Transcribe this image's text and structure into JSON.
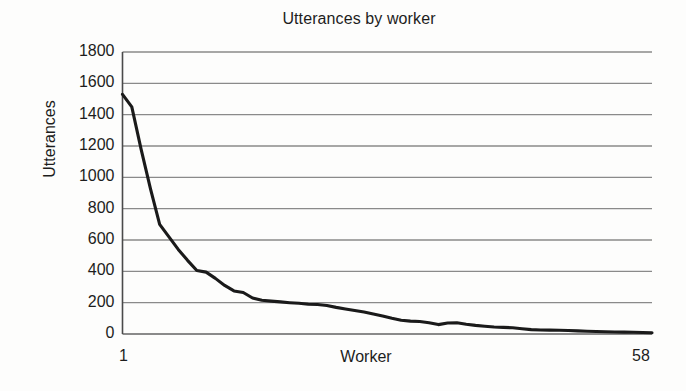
{
  "chart_data": {
    "type": "line",
    "title": "Utterances by worker",
    "xlabel": "Worker",
    "ylabel": "Utterances",
    "xlim": [
      1,
      58
    ],
    "ylim": [
      0,
      1800
    ],
    "grid": true,
    "legend": null,
    "legend_position": "none",
    "xtick_labels": [
      "1",
      "58"
    ],
    "ytick_labels": [
      "0",
      "200",
      "400",
      "600",
      "800",
      "1000",
      "1200",
      "1400",
      "1600",
      "1800"
    ],
    "ytick_values": [
      0,
      200,
      400,
      600,
      800,
      1000,
      1200,
      1400,
      1600,
      1800
    ],
    "line_color": "#1a1a1a",
    "grid_color": "#8a8a8a",
    "background_color": "#fdfdfc",
    "x": [
      1,
      2,
      3,
      4,
      5,
      6,
      7,
      8,
      9,
      10,
      11,
      12,
      13,
      14,
      15,
      16,
      17,
      18,
      19,
      20,
      21,
      22,
      23,
      24,
      25,
      26,
      27,
      28,
      29,
      30,
      31,
      32,
      33,
      34,
      35,
      36,
      37,
      38,
      39,
      40,
      41,
      42,
      43,
      44,
      45,
      46,
      47,
      48,
      49,
      50,
      51,
      52,
      53,
      54,
      55,
      56,
      57,
      58
    ],
    "values": [
      1530,
      1450,
      1180,
      930,
      700,
      620,
      540,
      470,
      405,
      395,
      355,
      310,
      275,
      265,
      230,
      215,
      210,
      205,
      200,
      196,
      190,
      188,
      182,
      170,
      160,
      150,
      140,
      128,
      115,
      100,
      88,
      82,
      80,
      72,
      60,
      70,
      72,
      62,
      55,
      50,
      45,
      42,
      40,
      34,
      28,
      26,
      25,
      24,
      22,
      20,
      18,
      16,
      14,
      13,
      12,
      11,
      10,
      8
    ],
    "series": [
      {
        "name": "Utterances",
        "values": [
          1530,
          1450,
          1180,
          930,
          700,
          620,
          540,
          470,
          405,
          395,
          355,
          310,
          275,
          265,
          230,
          215,
          210,
          205,
          200,
          196,
          190,
          188,
          182,
          170,
          160,
          150,
          140,
          128,
          115,
          100,
          88,
          82,
          80,
          72,
          60,
          70,
          72,
          62,
          55,
          50,
          45,
          42,
          40,
          34,
          28,
          26,
          25,
          24,
          22,
          20,
          18,
          16,
          14,
          13,
          12,
          11,
          10,
          8
        ]
      }
    ]
  },
  "figure": {
    "title": "Utterances by worker",
    "xlabel": "Worker",
    "ylabel": "Utterances",
    "xtick_first": "1",
    "xtick_last": "58"
  }
}
